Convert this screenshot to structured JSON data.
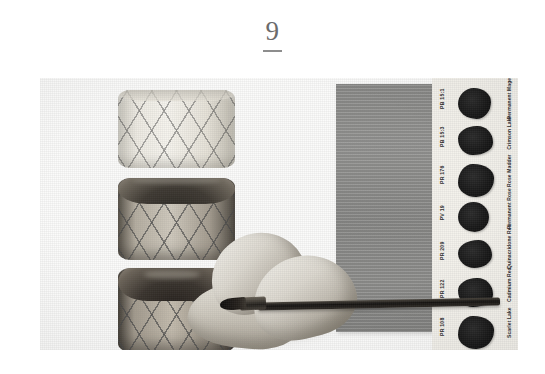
{
  "page": {
    "number": "9"
  },
  "photo": {
    "caption": "",
    "subjects": {
      "rings": [
        {
          "name": "carved band ring, light patterned",
          "pattern": "diamond lattice",
          "tone": "light"
        },
        {
          "name": "carved band ring, dark patterned",
          "pattern": "diamond lattice",
          "tone": "dark"
        },
        {
          "name": "carved band ring, dark patterned",
          "pattern": "diamond lattice",
          "tone": "dark"
        }
      ],
      "board": {
        "name": "gray board",
        "tone": "mid gray"
      },
      "hand": {
        "name": "hand holding paintbrush"
      }
    }
  },
  "swatch_card": {
    "rows": [
      {
        "code": "PB 15:1",
        "name": "Permanent Magenta"
      },
      {
        "code": "PB 15:3",
        "name": "Crimson Lake"
      },
      {
        "code": "PR 176",
        "name": "Rose Madder"
      },
      {
        "code": "PV 19",
        "name": "Permanent Rose"
      },
      {
        "code": "PR 209",
        "name": "Quinacridone Red"
      },
      {
        "code": "PR 122",
        "name": "Cadmium Red"
      },
      {
        "code": "PR 108",
        "name": "Scarlet Lake"
      }
    ]
  }
}
